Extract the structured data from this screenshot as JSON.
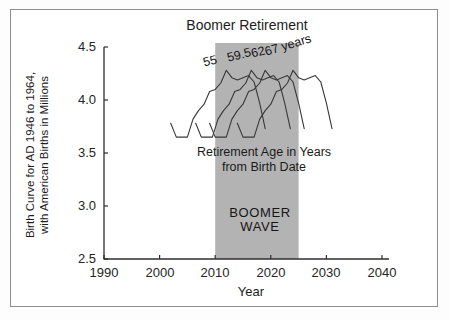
{
  "chart_data": {
    "type": "line",
    "title": "Boomer Retirement",
    "xlabel": "Year",
    "ylabel": "Birth Curve for AD 1946 to 1964, with American Births in Millions",
    "ylabel_line1": "Birth Curve for AD 1946 to 1964,",
    "ylabel_line2": "with American Births in Millions",
    "x_axis": {
      "range": [
        1990,
        2040
      ],
      "ticks": [
        "1990",
        "2000",
        "2010",
        "2020",
        "2030",
        "2040"
      ]
    },
    "y_axis": {
      "range": [
        2.5,
        4.5
      ],
      "ticks": [
        "4.5",
        "4.0",
        "3.5",
        "3.0",
        "2.5"
      ]
    },
    "grid": false,
    "legend": "none",
    "band": {
      "label_line1": "BOOMER",
      "label_line2": "WAVE",
      "x_start": 2010,
      "x_end": 2025,
      "color": "#b3b3b3"
    },
    "annotation": {
      "line1": "Retirement Age in Years",
      "line2": "from Birth Date"
    },
    "base_curve": {
      "note": "American births in millions by birth year; each series plots this curve shifted right by the retirement age",
      "years": [
        1947,
        1948,
        1949,
        1950,
        1951,
        1952,
        1953,
        1954,
        1955,
        1956,
        1957,
        1958,
        1959,
        1960,
        1961,
        1962,
        1963,
        1964
      ],
      "births_millions": [
        3.78,
        3.65,
        3.65,
        3.65,
        3.82,
        3.9,
        3.96,
        4.08,
        4.1,
        4.16,
        4.28,
        4.21,
        4.19,
        4.21,
        4.23,
        4.17,
        3.97,
        3.73
      ]
    },
    "series": [
      {
        "label": "55",
        "retirement_age": 55,
        "x_start": 2002,
        "x_end": 2019
      },
      {
        "label": "59.5",
        "retirement_age": 59.5,
        "x_start": 2006.5,
        "x_end": 2023.5
      },
      {
        "label": "62",
        "retirement_age": 62,
        "x_start": 2009,
        "x_end": 2026
      },
      {
        "label": "67 years",
        "retirement_age": 67,
        "x_start": 2014,
        "x_end": 2031
      }
    ],
    "line_color": "#383838",
    "axis_color": "#2e2e2e"
  }
}
